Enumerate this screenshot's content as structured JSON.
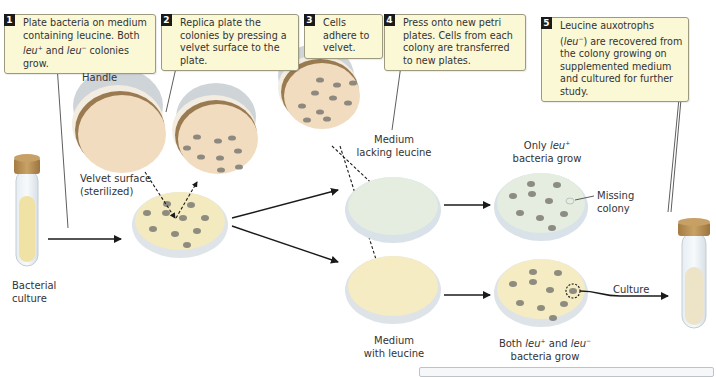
{
  "steps": [
    {
      "num": "1",
      "line1": "Plate bacteria on medium",
      "line2": "containing leucine. Both",
      "leu_plus": "leu",
      "plus_sup": "+",
      "and": " and ",
      "leu_minus": "leu",
      "minus_sup": "−",
      "tail": " colonies grow."
    },
    {
      "num": "2",
      "text": "Replica plate the colonies by pressing a velvet surface to the plate."
    },
    {
      "num": "3",
      "text": "Cells adhere to velvet."
    },
    {
      "num": "4",
      "text": "Press onto new petri plates. Cells from each colony are transferred to new plates."
    },
    {
      "num": "5",
      "pre": "Leucine auxotrophs (",
      "leu": "leu",
      "sup": "−",
      "post": ") are recovered from the colony growing on supplemented medium and cultured for further study."
    }
  ],
  "labels": {
    "handle": "Handle",
    "velvet_1": "Velvet surface",
    "velvet_2": "(sterilized)",
    "bacterial_1": "Bacterial",
    "bacterial_2": "culture",
    "lacking_1": "Medium",
    "lacking_2": "lacking leucine",
    "with_1": "Medium",
    "with_2": "with leucine",
    "only_pre": "Only ",
    "only_leu": "leu",
    "only_sup": "+",
    "only_post": "bacteria grow",
    "missing_1": "Missing",
    "missing_2": "colony",
    "both_pre": "Both ",
    "both_leu1": "leu",
    "both_sup1": "+",
    "both_and": " and ",
    "both_leu2": "leu",
    "both_sup2": "−",
    "both_post": "bacteria grow",
    "culture": "Culture"
  },
  "colors": {
    "callout_bg": "#fbf8d6",
    "velvet": "#f1dcc0",
    "agar_with_leucine": "#f5ecc4",
    "agar_lacking_leucine": "#e3ecdf",
    "colony": "#7d7b74",
    "handle": "#d5d9dd",
    "cap": "#b58c51"
  }
}
